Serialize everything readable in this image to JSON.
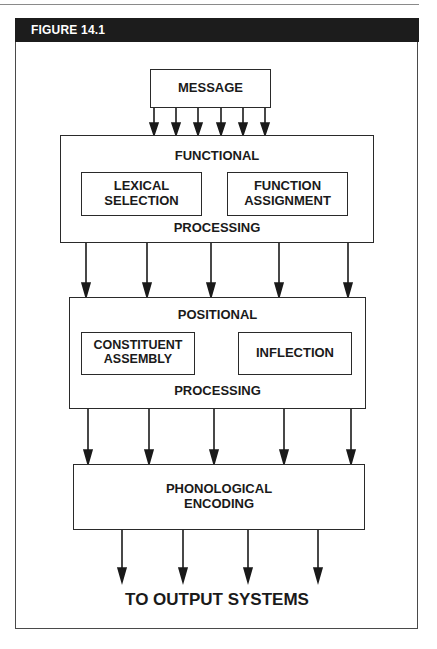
{
  "figure": {
    "title": "FIGURE 14.1"
  },
  "diagram": {
    "message": {
      "label": "MESSAGE"
    },
    "functional": {
      "title": "FUNCTIONAL",
      "footer": "PROCESSING",
      "sub_left": {
        "line1": "LEXICAL",
        "line2": "SELECTION"
      },
      "sub_right": {
        "line1": "FUNCTION",
        "line2": "ASSIGNMENT"
      }
    },
    "positional": {
      "title": "POSITIONAL",
      "footer": "PROCESSING",
      "sub_left": {
        "line1": "CONSTITUENT",
        "line2": "ASSEMBLY"
      },
      "sub_right": {
        "line1": "INFLECTION"
      }
    },
    "phonological": {
      "line1": "PHONOLOGICAL",
      "line2": "ENCODING"
    },
    "output": {
      "label": "TO OUTPUT SYSTEMS"
    },
    "arrow_counts": {
      "message_to_functional": 6,
      "functional_to_positional": 5,
      "positional_to_phonological": 5,
      "phonological_to_output": 4
    },
    "colors": {
      "header_bg": "#1c1c1c",
      "header_text": "#ffffff",
      "stroke": "#2a2a2a"
    }
  }
}
